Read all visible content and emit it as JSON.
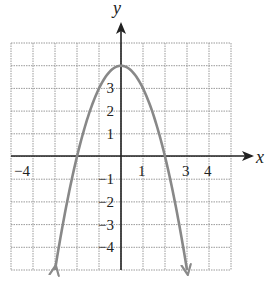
{
  "chart_data": {
    "type": "line",
    "title": "",
    "xlabel": "x",
    "ylabel": "y",
    "xlim": [
      -5,
      5
    ],
    "ylim": [
      -5,
      5
    ],
    "grid": true,
    "function": "y = 4 - x^2",
    "series": [
      {
        "name": "parabola",
        "color": "#888888",
        "x": [
          -3,
          -2.5,
          -2,
          -1.5,
          -1,
          -0.5,
          0,
          0.5,
          1,
          1.5,
          2,
          2.5,
          3
        ],
        "y": [
          -5,
          -2.25,
          0,
          1.75,
          3,
          3.75,
          4,
          3.75,
          3,
          1.75,
          0,
          -2.25,
          -5
        ],
        "arrows_at_ends": true
      }
    ],
    "x_tick_labels": [
      "-4",
      "1",
      "3",
      "4"
    ],
    "x_tick_values": [
      -4,
      1,
      3,
      4
    ],
    "y_tick_labels": [
      "3",
      "2",
      "1",
      "-1",
      "-2",
      "-3",
      "-4"
    ],
    "y_tick_values": [
      3,
      2,
      1,
      -1,
      -2,
      -3,
      -4
    ]
  },
  "labels": {
    "x_axis": "x",
    "y_axis": "y",
    "xt0": "−4",
    "xt1": "1",
    "xt2": "3",
    "xt3": "4",
    "yt0": "3",
    "yt1": "2",
    "yt2": "1",
    "yt3": "−1",
    "yt4": "−2",
    "yt5": "−3",
    "yt6": "−4"
  },
  "colors": {
    "grid": "#9a9a9a",
    "axis": "#222222",
    "curve": "#8a8a8a"
  }
}
